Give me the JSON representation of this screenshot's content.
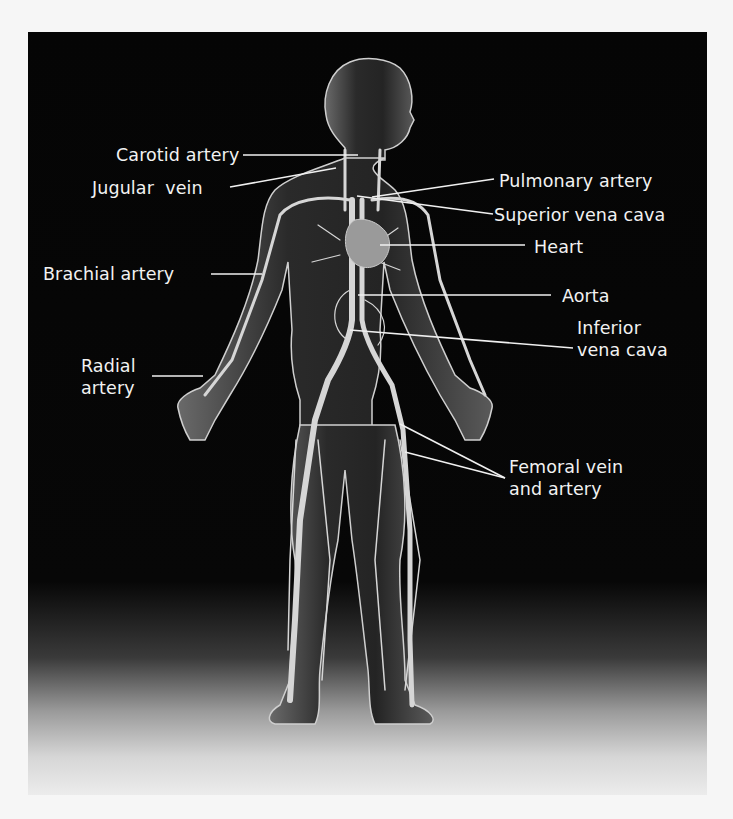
{
  "diagram": {
    "colors": {
      "background": "#050505",
      "page": "#f6f6f6",
      "label_text": "#f2f2f2",
      "leader_line": "#f0f0f0",
      "body_fill": "#4a4a4a",
      "vessel": "#d8d8d8",
      "heart": "#9a9a9a"
    },
    "labels_left": [
      {
        "id": "carotid",
        "text": "Carotid artery"
      },
      {
        "id": "jugular",
        "text": "Jugular  vein"
      },
      {
        "id": "brachial",
        "text": "Brachial artery"
      },
      {
        "id": "radial",
        "text": "Radial\nartery"
      }
    ],
    "labels_right": [
      {
        "id": "pulmonary",
        "text": "Pulmonary artery"
      },
      {
        "id": "svc",
        "text": "Superior vena cava"
      },
      {
        "id": "heart",
        "text": "Heart"
      },
      {
        "id": "aorta",
        "text": "Aorta"
      },
      {
        "id": "ivc",
        "text": "Inferior\nvena cava"
      },
      {
        "id": "femoral",
        "text": "Femoral vein\nand artery"
      }
    ]
  }
}
